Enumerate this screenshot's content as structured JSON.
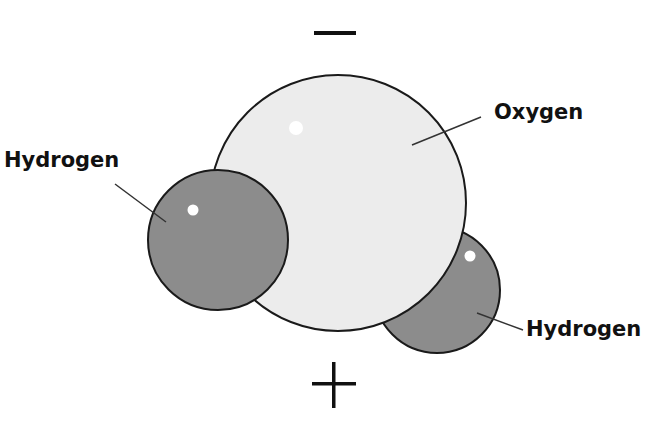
{
  "diagram": {
    "labels": {
      "oxygen": "Oxygen",
      "hydrogen_left": "Hydrogen",
      "hydrogen_right": "Hydrogen"
    },
    "charges": {
      "top": "−",
      "bottom": "+"
    },
    "atoms": [
      {
        "name": "Oxygen",
        "cx": 338,
        "cy": 203,
        "r": 128,
        "fill": "#ececec"
      },
      {
        "name": "Hydrogen",
        "cx": 218,
        "cy": 240,
        "r": 70,
        "fill": "#8c8c8c"
      },
      {
        "name": "Hydrogen",
        "cx": 437,
        "cy": 290,
        "r": 63,
        "fill": "#8c8c8c"
      }
    ],
    "colors": {
      "oxygen_fill": "#ececec",
      "hydrogen_fill": "#8c8c8c",
      "outline": "#1a1a1a",
      "highlight": "#ffffff",
      "text": "#111111"
    }
  }
}
